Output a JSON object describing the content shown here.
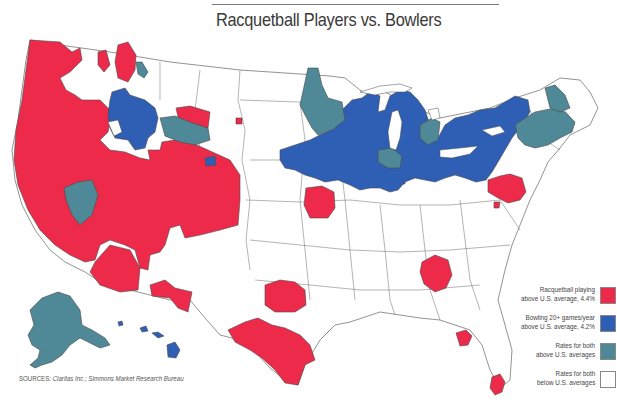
{
  "title": "Racquetball Players vs. Bowlers",
  "source": {
    "label": "SOURCES:",
    "text": "Claritas Inc.; Simmons Market Research Bureau"
  },
  "colors": {
    "racquetball": "#ee2a4a",
    "bowling": "#2e5fb4",
    "both_above": "#4f8896",
    "both_below": "#ffffff",
    "border": "#4a4a4a"
  },
  "legend": {
    "items": [
      {
        "label_line1": "Racquetball playing",
        "label_line2": "above U.S. average, 4.4%",
        "color_key": "racquetball"
      },
      {
        "label_line1": "Bowling 20+ games/year",
        "label_line2": "above U.S. average, 4.2%",
        "color_key": "bowling"
      },
      {
        "label_line1": "Rates for both",
        "label_line2": "above U.S. averages",
        "color_key": "both_above"
      },
      {
        "label_line1": "Rates for both",
        "label_line2": "below U.S. averages",
        "color_key": "both_below"
      }
    ]
  },
  "map": {
    "subject": "United States media markets",
    "insets": [
      "Alaska",
      "Hawaii"
    ],
    "regions_summary": {
      "racquetball_above": [
        "Pacific Northwest",
        "California",
        "Nevada",
        "Utah",
        "Arizona",
        "Colorado",
        "New Mexico (south)",
        "Oklahoma",
        "Texas (east/south)",
        "Missouri (Kansas City area)",
        "Georgia (Atlanta)",
        "Florida (Gainesville, Miami)",
        "Maryland / D.C."
      ],
      "bowling_above": [
        "Idaho / Montana (west)",
        "Minnesota (south)",
        "Wisconsin",
        "Iowa",
        "Illinois",
        "Indiana",
        "Michigan",
        "Ohio",
        "Pennsylvania",
        "New York (upstate)",
        "Hawaii"
      ],
      "both_above": [
        "Alaska",
        "Nevada (central)",
        "Wyoming (central)",
        "Minnesota (north)",
        "Chicago area",
        "Michigan (central)",
        "New England / New York City area"
      ]
    }
  }
}
